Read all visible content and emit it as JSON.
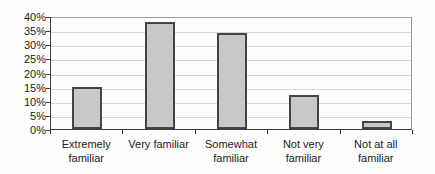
{
  "chart_data": {
    "type": "bar",
    "title": "",
    "xlabel": "",
    "ylabel": "",
    "categories": [
      "Extremely familiar",
      "Very familiar",
      "Somewhat familiar",
      "Not very familiar",
      "Not at all familiar"
    ],
    "values": [
      15,
      38,
      34,
      12,
      3
    ],
    "value_unit": "%",
    "ylim": [
      0,
      40
    ],
    "ytick_step": 5,
    "ytick_labels": [
      "0%",
      "5%",
      "10%",
      "15%",
      "20%",
      "25%",
      "30%",
      "35%",
      "40%"
    ],
    "grid": true,
    "legend": "none",
    "colors": {
      "bar_fill": "#c8c8c8",
      "bar_border": "#454545",
      "gridline": "#d6d6d6",
      "axis": "#3c3c3c",
      "plot_border": "#9a9a9a",
      "text": "#1c1c1c",
      "background": "#fdfdfc"
    }
  }
}
